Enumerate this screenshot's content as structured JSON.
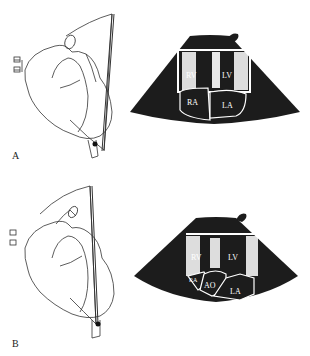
{
  "figure": {
    "panels": [
      {
        "id": "A",
        "label": "A",
        "view_labels": {
          "rv": "RV",
          "lv": "LV",
          "ra": "RA",
          "la": "LA",
          "as": "AS"
        }
      },
      {
        "id": "B",
        "label": "B",
        "view_labels": {
          "rv": "RV",
          "lv": "LV",
          "ra": "RA",
          "ao": "AO",
          "la": "LA"
        }
      }
    ],
    "colors": {
      "sector": "#1c1c1c",
      "line": "#333333",
      "background": "#ffffff"
    }
  }
}
